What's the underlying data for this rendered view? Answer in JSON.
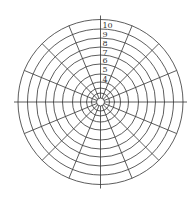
{
  "diagram": {
    "type": "polar-grid",
    "center": [
      100.5,
      102
    ],
    "inner_radius": 4,
    "rings": [
      {
        "label": "1",
        "r": 9
      },
      {
        "label": "2",
        "r": 14
      },
      {
        "label": "3",
        "r": 20
      },
      {
        "label": "4",
        "r": 28
      },
      {
        "label": "5",
        "r": 38
      },
      {
        "label": "6",
        "r": 47
      },
      {
        "label": "7",
        "r": 55
      },
      {
        "label": "8",
        "r": 64
      },
      {
        "label": "9",
        "r": 73
      },
      {
        "label": "10",
        "r": 82.5
      }
    ],
    "spoke_count": 16,
    "line_color": "#333333"
  }
}
